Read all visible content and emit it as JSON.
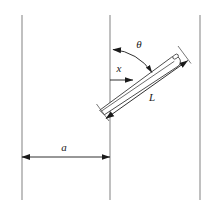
{
  "figure": {
    "name": "buffon-needle-diagram",
    "background_color": "#ffffff",
    "line_color": "#8c8c8c",
    "ink_color": "#1a1a1a"
  },
  "labels": {
    "angle": "θ",
    "distance": "x",
    "needle_length": "L",
    "line_spacing": "a"
  },
  "geometry": {
    "floor_lines": [
      {
        "name": "floor-line-left",
        "x": 22,
        "y1": 15,
        "y2": 200
      },
      {
        "name": "floor-line-middle",
        "x": 110,
        "y1": 15,
        "y2": 200
      },
      {
        "name": "floor-line-right",
        "x": 200,
        "y1": 15,
        "y2": 200
      }
    ],
    "needle": {
      "tip_x": 100,
      "tip_y": 110,
      "head_x": 182,
      "head_y": 50,
      "angle_deg": 36,
      "width": 11,
      "eye_cx": 176,
      "eye_cy": 56,
      "eye_rx": 3.0,
      "eye_ry": 2.0
    },
    "angle_arc": {
      "center_x": 110,
      "center_y": 100,
      "radius": 52,
      "start_deg": 90,
      "end_deg": 54
    },
    "x_arrow": {
      "x1": 110,
      "y1": 80,
      "x2": 133,
      "y2": 80
    },
    "a_arrow": {
      "x1": 22,
      "y1": 157,
      "x2": 110,
      "y2": 157
    },
    "label_positions": {
      "angle": {
        "x": 139,
        "y": 45
      },
      "distance": {
        "x": 119,
        "y": 70
      },
      "needle_length": {
        "x": 152,
        "y": 99
      },
      "line_spacing": {
        "x": 64,
        "y": 149
      }
    }
  }
}
